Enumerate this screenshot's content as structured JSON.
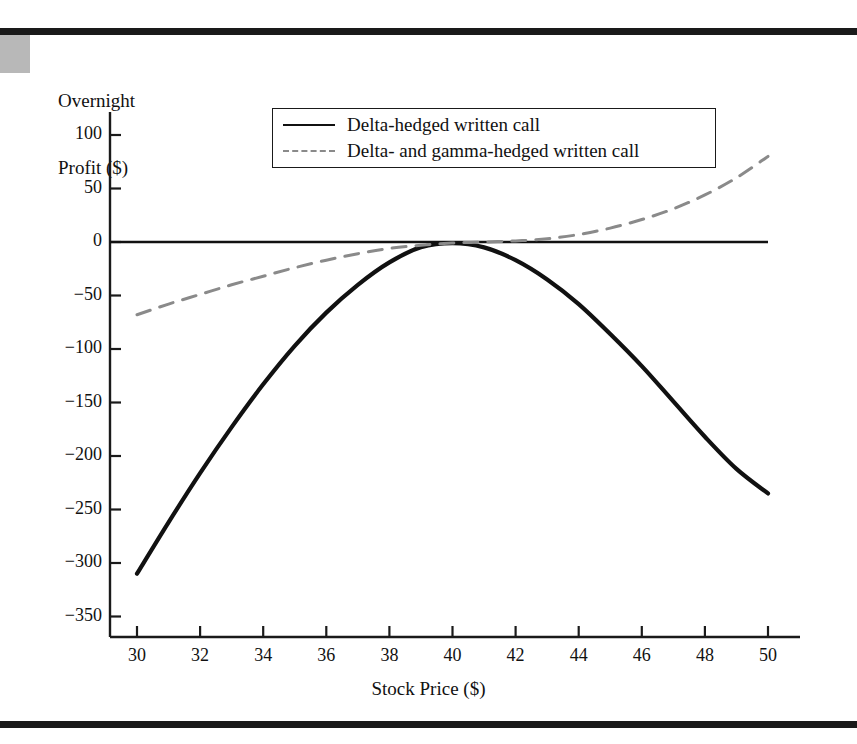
{
  "figure": {
    "top_rule": "page-rule-top",
    "bottom_rule": "page-rule-bottom"
  },
  "chart_data": {
    "type": "line",
    "title": "",
    "xlabel": "Stock Price ($)",
    "ylabel": "Overnight Profit ($)",
    "ylabel_lines": [
      "Overnight",
      "Profit ($)"
    ],
    "xlim": [
      30,
      50
    ],
    "ylim": [
      -375,
      120
    ],
    "xticks": [
      30,
      32,
      34,
      36,
      38,
      40,
      42,
      44,
      46,
      48,
      50
    ],
    "xticklabels": [
      "30",
      "32",
      "34",
      "36",
      "38",
      "40",
      "42",
      "44",
      "46",
      "48",
      "50"
    ],
    "yticks": [
      100,
      50,
      0,
      -50,
      -100,
      -150,
      -200,
      -250,
      -300,
      -350
    ],
    "yticklabels": [
      "100",
      "50",
      "0",
      "−50",
      "−100",
      "−150",
      "−200",
      "−250",
      "−300",
      "−350"
    ],
    "grid": false,
    "legend_position": "upper-center",
    "zero_line": true,
    "series": [
      {
        "name": "Delta-hedged written call",
        "style": "solid",
        "color": "#111111",
        "width": 4.2,
        "x": [
          30,
          31,
          32,
          33,
          34,
          35,
          36,
          37,
          38,
          39,
          40,
          41,
          42,
          43,
          44,
          45,
          46,
          47,
          48,
          49,
          50
        ],
        "y": [
          -310,
          -262,
          -216,
          -173,
          -133,
          -97,
          -66,
          -40,
          -19,
          -5,
          -1,
          -5,
          -17,
          -35,
          -58,
          -86,
          -116,
          -149,
          -182,
          -212,
          -235
        ]
      },
      {
        "name": "Delta- and gamma-hedged written call",
        "style": "dashed",
        "color": "#8a8a8a",
        "width": 3.0,
        "x": [
          30,
          31,
          32,
          33,
          34,
          35,
          36,
          37,
          38,
          39,
          40,
          41,
          42,
          43,
          44,
          45,
          46,
          47,
          48,
          49,
          50
        ],
        "y": [
          -68,
          -58,
          -49,
          -40,
          -32,
          -24,
          -17,
          -11,
          -6,
          -3,
          -1,
          0,
          1,
          3,
          7,
          13,
          21,
          31,
          44,
          60,
          80
        ]
      }
    ],
    "legend": [
      {
        "label": "Delta-hedged written call",
        "style": "solid",
        "color": "#111111"
      },
      {
        "label": "Delta- and gamma-hedged written call",
        "style": "dashed",
        "color": "#8a8a8a"
      }
    ]
  }
}
